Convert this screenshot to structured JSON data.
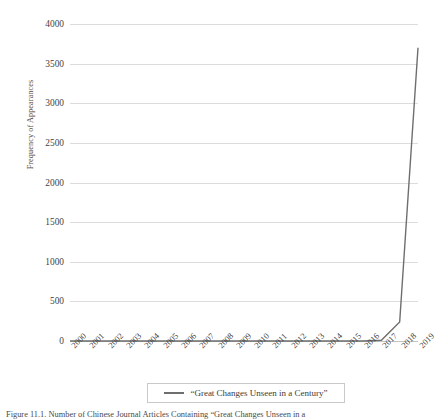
{
  "chart_data": {
    "type": "line",
    "title": "",
    "xlabel": "",
    "ylabel": "Frequency of Appearances",
    "categories": [
      "2000",
      "2001",
      "2002",
      "2003",
      "2004",
      "2005",
      "2006",
      "2007",
      "2008",
      "2009",
      "2010",
      "2011",
      "2012",
      "2013",
      "2014",
      "2015",
      "2016",
      "2017",
      "2018",
      "2019"
    ],
    "series": [
      {
        "name": "“Great Changes Unseen in a Century”",
        "values": [
          0,
          0,
          0,
          0,
          0,
          0,
          0,
          0,
          0,
          0,
          0,
          0,
          0,
          0,
          0,
          0,
          0,
          10,
          240,
          3700
        ],
        "color": "#6e6e6e"
      }
    ],
    "ylim": [
      0,
      4000
    ],
    "yticks": [
      0,
      500,
      1000,
      1500,
      2000,
      2500,
      3000,
      3500,
      4000
    ],
    "grid": true,
    "legend_position": "bottom"
  },
  "legend": {
    "swatch_name": "line-swatch",
    "label": "“Great Changes Unseen in a Century”"
  },
  "caption": {
    "text": "Figure 11.1. Number of Chinese Journal Articles Containing “Great Changes Unseen in a"
  },
  "colors": {
    "line": "#6e6e6e",
    "grid": "#dcdcdc",
    "baseline": "#c4c4c4",
    "text": "#3b3b3b",
    "legend_border": "#c9c9c9",
    "background": "#ffffff"
  }
}
